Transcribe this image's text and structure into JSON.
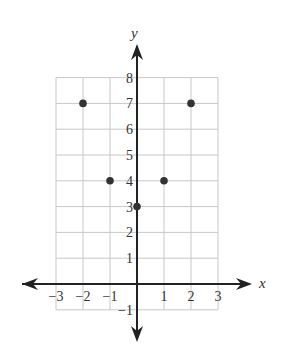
{
  "chart_data": {
    "type": "scatter",
    "title": "",
    "xlabel": "x",
    "ylabel": "y",
    "xlim": [
      -3,
      3
    ],
    "ylim": [
      -1,
      8
    ],
    "grid": true,
    "x_ticks": [
      "-3",
      "-2",
      "-1",
      "1",
      "2",
      "3"
    ],
    "y_ticks": [
      "-1",
      "1",
      "2",
      "3",
      "4",
      "5",
      "6",
      "7",
      "8"
    ],
    "points": [
      {
        "x": -2,
        "y": 7
      },
      {
        "x": -1,
        "y": 4
      },
      {
        "x": 0,
        "y": 3
      },
      {
        "x": 1,
        "y": 4
      },
      {
        "x": 2,
        "y": 7
      }
    ],
    "legend": []
  },
  "colors": {
    "grid": "#c8c8c8",
    "axis": "#222222",
    "point": "#333333"
  }
}
